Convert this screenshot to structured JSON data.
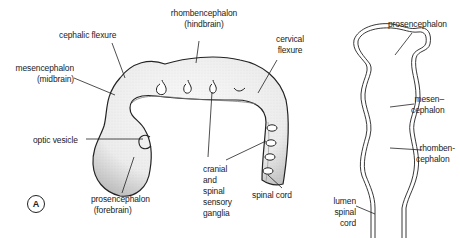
{
  "figure": {
    "panel_label": "A",
    "left_diagram": {
      "title": "embryonic brain lateral view",
      "labels": {
        "cephalic_flexure": "cephalic flexure",
        "rhombencephalon": [
          "rhombencephalon",
          "(hindbrain)"
        ],
        "mesencephalon": [
          "mesencephalon",
          "(midbrain)"
        ],
        "cervical_flexure": [
          "cervical",
          "flexure"
        ],
        "optic_vesicle": "optic vesicle",
        "prosencephalon": [
          "prosencephalon",
          "(forebrain)"
        ],
        "ganglia": [
          "cranial",
          "and",
          "spinal",
          "sensory",
          "ganglia"
        ],
        "spinal_cord": "spinal cord"
      }
    },
    "right_diagram": {
      "title": "neural tube section",
      "labels": {
        "prosencephalon": "prosencephalon",
        "mesencephalon": [
          "mesen–",
          "cephalon"
        ],
        "rhombencephalon": [
          "rhomben-",
          "cephalon"
        ],
        "lumen_spinal_cord": [
          "lumen",
          "spinal",
          "cord"
        ]
      }
    },
    "colors": {
      "ink": "#222222",
      "stipple": "#9a9a9a",
      "background": "#ffffff"
    }
  }
}
